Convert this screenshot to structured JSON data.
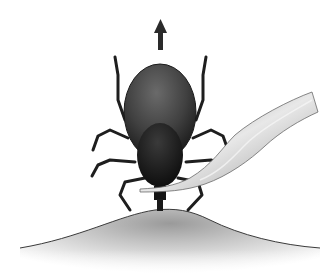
{
  "image": {
    "description": "Illustration of a tick being removed from skin with fine-tipped tweezers, arrow pointing upward indicating pull direction",
    "elements": [
      "up-arrow",
      "tick-body",
      "tick-legs",
      "tweezers",
      "skin-bump"
    ]
  },
  "colors": {
    "background": "#ffffff",
    "tick_dark": "#1e1e1e",
    "tick_body": "#4a4a4a",
    "skin": "#c8c8c8",
    "tweezers": "#bdbdbd",
    "arrow": "#2a2a2a"
  }
}
